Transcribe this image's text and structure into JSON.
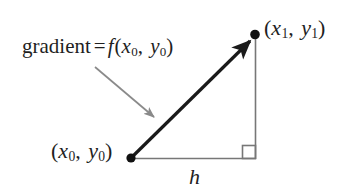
{
  "figure": {
    "background_color": "#ffffff",
    "width": 355,
    "height": 192,
    "colors": {
      "hypotenuse": "#1a1a1a",
      "legs": "#777777",
      "pointer_arrow": "#8a8a8a",
      "text": "#1f1f1f",
      "vertex_dot": "#111111"
    }
  },
  "labels": {
    "gradient": {
      "word": "gradient",
      "equals": "=",
      "function_symbol": "f",
      "open_paren": "(",
      "var_x": "x",
      "sub_x": "0",
      "comma": ",",
      "var_y": "y",
      "sub_y": "0",
      "close_paren": ")",
      "full_text": "gradient = f(x0, y0)"
    },
    "point_end": {
      "open_paren": "(",
      "var_x": "x",
      "sub_x": "1",
      "comma": ",",
      "var_y": "y",
      "sub_y": "1",
      "close_paren": ")",
      "full_text": "(x1, y1)"
    },
    "point_start": {
      "open_paren": "(",
      "var_x": "x",
      "sub_x": "0",
      "comma": ",",
      "var_y": "y",
      "sub_y": "0",
      "close_paren": ")",
      "full_text": "(x0, y0)"
    },
    "run_length": {
      "symbol": "h"
    }
  },
  "geometry": {
    "start_point": {
      "x": 131,
      "y": 158
    },
    "end_point": {
      "x": 255,
      "y": 35
    },
    "corner_point": {
      "x": 255,
      "y": 158
    },
    "right_angle_marker": {
      "x": 242,
      "y": 145,
      "size": 14
    },
    "pointer_arrow": {
      "x1": 95,
      "y1": 67,
      "x2": 156,
      "y2": 119
    }
  }
}
